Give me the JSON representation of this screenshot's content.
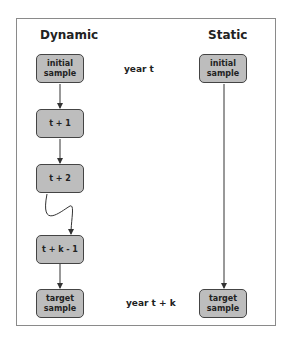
{
  "columns": {
    "dynamic": {
      "title": "Dynamic"
    },
    "static": {
      "title": "Static"
    }
  },
  "time_labels": {
    "start": "year t",
    "end": "year t + k"
  },
  "dynamic_nodes": [
    {
      "id": "initial",
      "line1": "initial",
      "line2": "sample"
    },
    {
      "id": "t1",
      "line1": "t + 1",
      "line2": ""
    },
    {
      "id": "t2",
      "line1": "t + 2",
      "line2": ""
    },
    {
      "id": "tk1",
      "line1": "t + k - 1",
      "line2": ""
    },
    {
      "id": "target",
      "line1": "target",
      "line2": "sample"
    }
  ],
  "static_nodes": [
    {
      "id": "initial",
      "line1": "initial",
      "line2": "sample"
    },
    {
      "id": "target",
      "line1": "target",
      "line2": "sample"
    }
  ]
}
